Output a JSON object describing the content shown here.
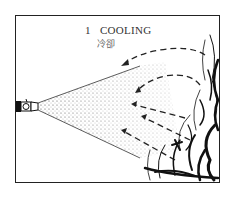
{
  "diagram": {
    "number": "1",
    "title": "COOLING",
    "subtitle_cn": "冷卻",
    "elements": [
      "nozzle-icon",
      "water-spray-cone",
      "heat-flow-arrows",
      "fire-flames"
    ],
    "colors": {
      "ink": "#222222",
      "background": "#ffffff"
    }
  }
}
